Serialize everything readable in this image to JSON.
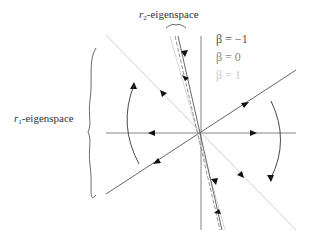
{
  "labels": {
    "r2_symbol": "r",
    "r2_sub": "2",
    "r2_text": "-eigenspace",
    "r1_symbol": "r",
    "r1_sub": "1",
    "r1_text": "-eigenspace"
  },
  "legend": [
    {
      "label": "β = −1",
      "color": "#555555"
    },
    {
      "label": "β = 0",
      "color": "#888888"
    },
    {
      "label": "β = 1",
      "color": "#cccccc"
    }
  ],
  "colors": {
    "axis": "#666666",
    "dark_line": "#555555",
    "light_line": "#c8c8c8",
    "arrow": "#111111"
  }
}
